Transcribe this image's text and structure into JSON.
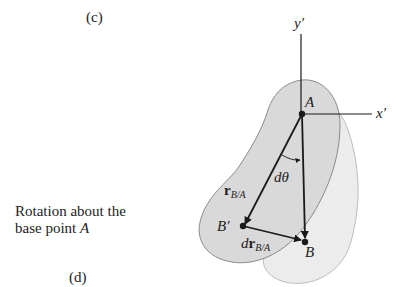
{
  "figure": {
    "label_top": "(c)",
    "label_bottom": "(d)",
    "caption_line1": "Rotation about the",
    "caption_line2_prefix": "base point ",
    "caption_line2_point": "A"
  },
  "axes": {
    "y_label": "y′",
    "x_label": "x′"
  },
  "points": {
    "A": "A",
    "B": "B",
    "B_prime": "B′"
  },
  "vectors": {
    "r_main": "r",
    "r_sub": "B/A",
    "dr_prefix": "d",
    "dr_main": "r",
    "dr_sub": "B/A"
  },
  "angle": {
    "label": "dθ"
  },
  "colors": {
    "body_front": "#d9d9d9",
    "body_back": "#ececec",
    "outline": "#8a8a8a",
    "ink": "#1a1a1a"
  }
}
